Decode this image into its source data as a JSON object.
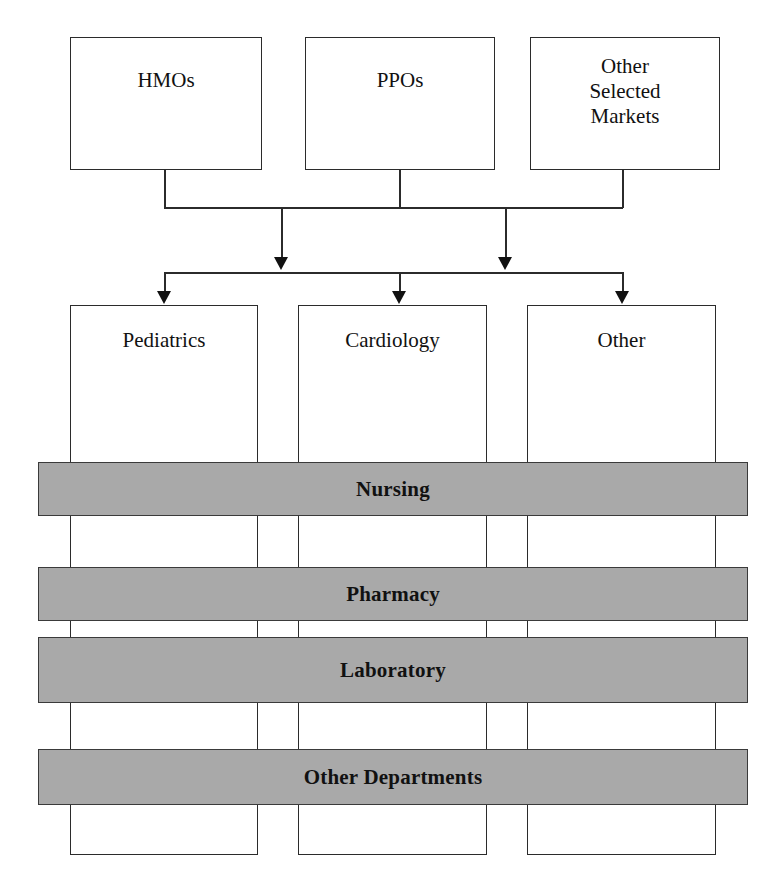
{
  "diagram": {
    "colors": {
      "bar_fill": "#a9a9a9",
      "bar_stroke": "#3a3a3a",
      "box_fill": "#ffffff",
      "box_stroke": "#2b2b2b",
      "text": "#111111"
    },
    "markets": [
      {
        "label": "HMOs"
      },
      {
        "label": "PPOs"
      },
      {
        "label": "Other\nSelected\nMarkets"
      }
    ],
    "service_lines": [
      {
        "label": "Pediatrics"
      },
      {
        "label": "Cardiology"
      },
      {
        "label": "Other"
      }
    ],
    "departments": [
      {
        "label": "Nursing"
      },
      {
        "label": "Pharmacy"
      },
      {
        "label": "Laboratory"
      },
      {
        "label": "Other Departments"
      }
    ]
  }
}
